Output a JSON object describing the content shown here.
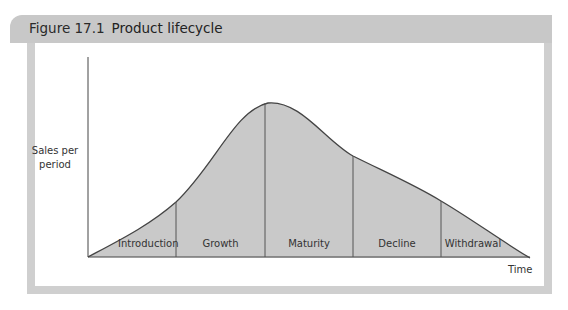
{
  "figure": {
    "label": "Figure 17.1",
    "title": "Product lifecycle"
  },
  "axes": {
    "ylabel_line1": "Sales per",
    "ylabel_line2": "period",
    "xlabel": "Time"
  },
  "stages": [
    {
      "label": "Introduction"
    },
    {
      "label": "Growth"
    },
    {
      "label": "Maturity"
    },
    {
      "label": "Decline"
    },
    {
      "label": "Withdrawal"
    }
  ],
  "colors": {
    "header_bg": "#c8c8c8",
    "frame": "#cfcfcf",
    "fill": "#c9c9c9",
    "line": "#444444"
  }
}
